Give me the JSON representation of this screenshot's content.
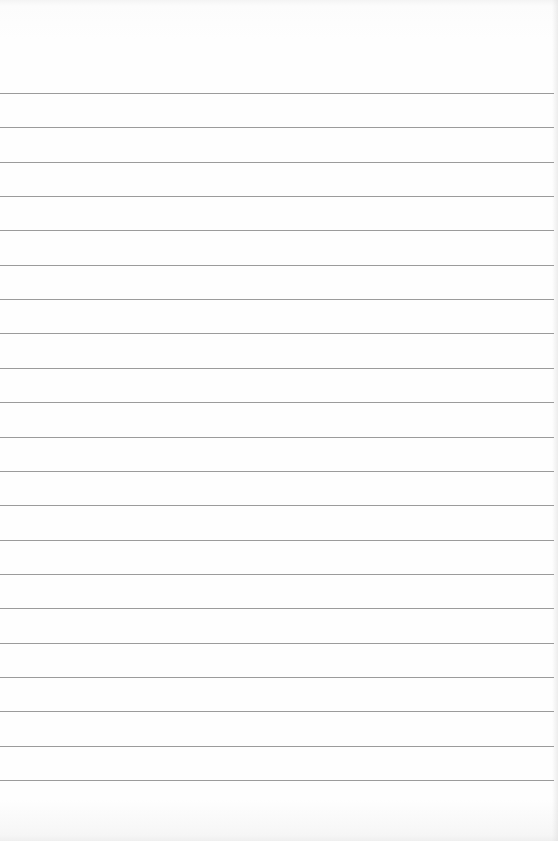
{
  "page": {
    "type": "lined-paper",
    "background_color": "#fefefe",
    "line_color": "#8a8a8a",
    "line_count": 21,
    "first_line_y": 93,
    "line_spacing": 34.35,
    "line_width": 554
  }
}
